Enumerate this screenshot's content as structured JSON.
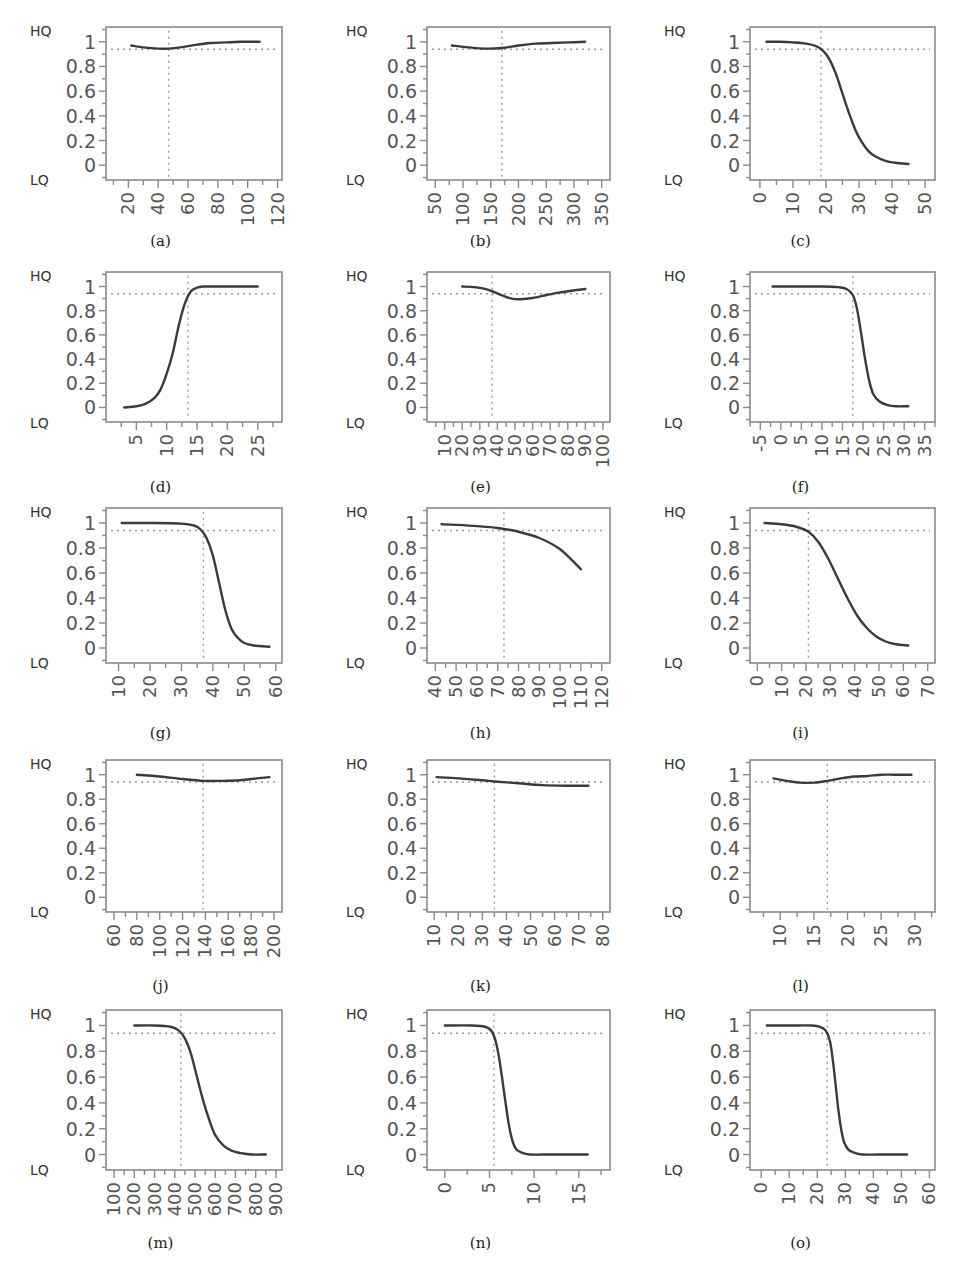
{
  "figure": {
    "y_label_top": "HQ",
    "y_label_bottom": "LQ",
    "y_ticks": [
      "1",
      "0.8",
      "0.6",
      "0.4",
      "0.2",
      "0"
    ],
    "colors": {
      "curve": "#3a3a3a",
      "axis": "#8a8a8a",
      "ref": "#9a9a9a",
      "text": "#555555",
      "label": "#333333"
    }
  },
  "chart_data": [
    {
      "id": "a",
      "type": "line",
      "caption_letter": "a",
      "xticks": [
        20,
        40,
        60,
        80,
        100,
        120
      ],
      "xlim": [
        5,
        123
      ],
      "ylim": [
        -0.12,
        1.12
      ],
      "vline": 47,
      "hline": 0.94,
      "x": [
        22,
        30,
        40,
        47,
        55,
        65,
        75,
        85,
        95,
        108
      ],
      "y": [
        0.97,
        0.955,
        0.945,
        0.945,
        0.955,
        0.975,
        0.99,
        0.995,
        1.0,
        1.0
      ]
    },
    {
      "id": "b",
      "type": "line",
      "caption_letter": "b",
      "xticks": [
        50,
        100,
        150,
        200,
        250,
        300,
        350
      ],
      "xlim": [
        35,
        365
      ],
      "ylim": [
        -0.12,
        1.12
      ],
      "vline": 170,
      "hline": 0.94,
      "x": [
        80,
        110,
        140,
        170,
        200,
        230,
        260,
        290,
        320
      ],
      "y": [
        0.97,
        0.955,
        0.945,
        0.95,
        0.97,
        0.985,
        0.99,
        0.995,
        1.0
      ]
    },
    {
      "id": "c",
      "type": "line",
      "caption_letter": "c",
      "xticks": [
        0,
        10,
        20,
        30,
        40,
        50
      ],
      "xlim": [
        -3,
        53
      ],
      "ylim": [
        -0.12,
        1.12
      ],
      "vline": 18.5,
      "hline": 0.94,
      "x": [
        2,
        6,
        10,
        14,
        17,
        19,
        21,
        23,
        25,
        27,
        29,
        31,
        33,
        35,
        38,
        41,
        45
      ],
      "y": [
        1.0,
        1.0,
        0.995,
        0.985,
        0.965,
        0.93,
        0.86,
        0.74,
        0.58,
        0.42,
        0.28,
        0.18,
        0.11,
        0.07,
        0.035,
        0.02,
        0.01
      ]
    },
    {
      "id": "d",
      "type": "line",
      "caption_letter": "d",
      "xticks": [
        5,
        10,
        15,
        20,
        25
      ],
      "xlim": [
        0,
        29
      ],
      "ylim": [
        -0.12,
        1.12
      ],
      "vline": 13.5,
      "hline": 0.94,
      "x": [
        3,
        5,
        6.5,
        8,
        9,
        10,
        11,
        12,
        13,
        14,
        15,
        16,
        18,
        21,
        25
      ],
      "y": [
        0.0,
        0.01,
        0.03,
        0.08,
        0.15,
        0.28,
        0.45,
        0.68,
        0.86,
        0.96,
        0.99,
        1.0,
        1.0,
        1.0,
        1.0
      ]
    },
    {
      "id": "e",
      "type": "line",
      "caption_letter": "e",
      "xticks": [
        10,
        20,
        30,
        40,
        50,
        60,
        70,
        80,
        90,
        100
      ],
      "xlim": [
        0,
        104
      ],
      "ylim": [
        -0.12,
        1.12
      ],
      "vline": 37,
      "hline": 0.94,
      "x": [
        20,
        27,
        33,
        38,
        43,
        48,
        53,
        60,
        68,
        75,
        82,
        90
      ],
      "y": [
        1.0,
        0.995,
        0.98,
        0.955,
        0.925,
        0.9,
        0.895,
        0.905,
        0.93,
        0.95,
        0.965,
        0.98
      ]
    },
    {
      "id": "f",
      "type": "line",
      "caption_letter": "f",
      "xticks": [
        -5,
        0,
        5,
        10,
        15,
        20,
        25,
        30,
        35
      ],
      "xlim": [
        -7.5,
        37.5
      ],
      "ylim": [
        -0.12,
        1.12
      ],
      "vline": 17.5,
      "hline": 0.94,
      "x": [
        -2,
        5,
        10,
        14,
        16,
        17.5,
        18.5,
        19.5,
        20.5,
        21.5,
        22.5,
        24,
        26,
        28,
        31
      ],
      "y": [
        1.0,
        1.0,
        1.0,
        0.995,
        0.98,
        0.93,
        0.82,
        0.62,
        0.4,
        0.22,
        0.11,
        0.05,
        0.02,
        0.01,
        0.01
      ]
    },
    {
      "id": "g",
      "type": "line",
      "caption_letter": "g",
      "xticks": [
        10,
        20,
        30,
        40,
        50,
        60
      ],
      "xlim": [
        6,
        62
      ],
      "ylim": [
        -0.12,
        1.12
      ],
      "vline": 37,
      "hline": 0.94,
      "x": [
        11,
        20,
        30,
        34,
        36,
        38,
        40,
        42,
        44,
        46,
        48,
        50,
        53,
        58
      ],
      "y": [
        1.0,
        1.0,
        0.995,
        0.98,
        0.95,
        0.88,
        0.74,
        0.52,
        0.3,
        0.15,
        0.08,
        0.04,
        0.02,
        0.01
      ]
    },
    {
      "id": "h",
      "type": "line",
      "caption_letter": "h",
      "xticks": [
        40,
        50,
        60,
        70,
        80,
        90,
        100,
        110,
        120
      ],
      "xlim": [
        36,
        124
      ],
      "ylim": [
        -0.12,
        1.12
      ],
      "vline": 73,
      "hline": 0.94,
      "x": [
        43,
        50,
        60,
        70,
        80,
        90,
        100,
        110
      ],
      "y": [
        0.99,
        0.985,
        0.975,
        0.96,
        0.93,
        0.88,
        0.79,
        0.63
      ]
    },
    {
      "id": "i",
      "type": "line",
      "caption_letter": "i",
      "xticks": [
        0,
        10,
        20,
        30,
        40,
        50,
        60,
        70
      ],
      "xlim": [
        -3,
        73
      ],
      "ylim": [
        -0.12,
        1.12
      ],
      "vline": 21,
      "hline": 0.94,
      "x": [
        3,
        10,
        16,
        21,
        25,
        29,
        33,
        37,
        41,
        45,
        49,
        53,
        57,
        62
      ],
      "y": [
        1.0,
        0.99,
        0.97,
        0.93,
        0.85,
        0.72,
        0.56,
        0.4,
        0.26,
        0.16,
        0.09,
        0.05,
        0.03,
        0.02
      ]
    },
    {
      "id": "j",
      "type": "line",
      "caption_letter": "j",
      "xticks": [
        60,
        80,
        100,
        120,
        140,
        160,
        180,
        200
      ],
      "xlim": [
        53,
        207
      ],
      "ylim": [
        -0.12,
        1.12
      ],
      "vline": 138,
      "hline": 0.94,
      "x": [
        80,
        100,
        120,
        138,
        155,
        170,
        185,
        196
      ],
      "y": [
        1.0,
        0.985,
        0.965,
        0.95,
        0.95,
        0.955,
        0.97,
        0.98
      ]
    },
    {
      "id": "k",
      "type": "line",
      "caption_letter": "k",
      "xticks": [
        10,
        20,
        30,
        40,
        50,
        60,
        70,
        80
      ],
      "xlim": [
        7,
        83
      ],
      "ylim": [
        -0.12,
        1.12
      ],
      "vline": 35,
      "hline": 0.94,
      "x": [
        11,
        20,
        30,
        35,
        45,
        55,
        65,
        74
      ],
      "y": [
        0.98,
        0.97,
        0.955,
        0.945,
        0.93,
        0.915,
        0.91,
        0.91
      ]
    },
    {
      "id": "l",
      "type": "line",
      "caption_letter": "l",
      "xticks": [
        10,
        15,
        20,
        25,
        30
      ],
      "xlim": [
        5.5,
        33
      ],
      "ylim": [
        -0.12,
        1.12
      ],
      "vline": 17,
      "hline": 0.94,
      "x": [
        9,
        11,
        13,
        15,
        17,
        19,
        21,
        23,
        25,
        27,
        29.5
      ],
      "y": [
        0.97,
        0.95,
        0.935,
        0.935,
        0.95,
        0.97,
        0.985,
        0.99,
        1.0,
        1.0,
        1.0
      ]
    },
    {
      "id": "m",
      "type": "line",
      "caption_letter": "m",
      "xticks": [
        100,
        200,
        300,
        400,
        500,
        600,
        700,
        800,
        900
      ],
      "xlim": [
        60,
        930
      ],
      "ylim": [
        -0.12,
        1.12
      ],
      "vline": 430,
      "hline": 0.94,
      "x": [
        200,
        300,
        380,
        420,
        450,
        480,
        510,
        540,
        570,
        600,
        640,
        680,
        730,
        780,
        850
      ],
      "y": [
        1.0,
        1.0,
        0.99,
        0.96,
        0.9,
        0.78,
        0.6,
        0.42,
        0.27,
        0.15,
        0.07,
        0.03,
        0.01,
        0.0,
        0.0
      ]
    },
    {
      "id": "n",
      "type": "line",
      "caption_letter": "n",
      "xticks": [
        0,
        5,
        10,
        15
      ],
      "xlim": [
        -2,
        18.5
      ],
      "ylim": [
        -0.12,
        1.12
      ],
      "vline": 5.5,
      "hline": 0.94,
      "x": [
        0,
        3,
        4.5,
        5.2,
        5.6,
        6,
        6.4,
        6.8,
        7.2,
        7.6,
        8,
        8.6,
        9.5,
        11,
        13,
        16
      ],
      "y": [
        1.0,
        1.0,
        0.99,
        0.96,
        0.9,
        0.78,
        0.6,
        0.4,
        0.22,
        0.1,
        0.04,
        0.015,
        0.0,
        0.0,
        0.0,
        0.0
      ]
    },
    {
      "id": "o",
      "type": "line",
      "caption_letter": "o",
      "xticks": [
        0,
        10,
        20,
        30,
        40,
        50,
        60
      ],
      "xlim": [
        -4,
        62
      ],
      "ylim": [
        -0.12,
        1.12
      ],
      "vline": 23.5,
      "hline": 0.94,
      "x": [
        2,
        10,
        18,
        21,
        23,
        24.5,
        25.5,
        26.5,
        27.5,
        28.5,
        29.5,
        31,
        33,
        36,
        42,
        52
      ],
      "y": [
        1.0,
        1.0,
        1.0,
        0.99,
        0.96,
        0.88,
        0.74,
        0.55,
        0.35,
        0.2,
        0.1,
        0.04,
        0.015,
        0.0,
        0.0,
        0.0
      ]
    }
  ],
  "captions": {
    "a": "(a)",
    "b": "(b)",
    "c": "(c)",
    "d": "(d)",
    "e": "(e)",
    "f": "(f)",
    "g": "(g)",
    "h": "(h)",
    "i": "(i)",
    "j": "(j)",
    "k": "(k)",
    "l": "(l)",
    "m": "(m)",
    "n": "(n)",
    "o": "(o)"
  }
}
